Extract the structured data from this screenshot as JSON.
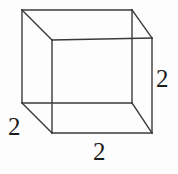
{
  "figure": {
    "name": "cube-wireframe-diagram",
    "background_color": "#fdfdfd",
    "stroke_color": "#3a3a3a",
    "stroke_width": 1.4,
    "width": 178,
    "height": 174
  },
  "shape": {
    "type": "cube",
    "label": "cube",
    "front_face": {
      "name": "front-face",
      "points": [
        [
          52,
          40
        ],
        [
          152,
          38
        ],
        [
          152,
          133
        ],
        [
          52,
          133
        ]
      ]
    },
    "back_face": {
      "name": "back-face",
      "points": [
        [
          22,
          10
        ],
        [
          132,
          10
        ],
        [
          132,
          103
        ],
        [
          22,
          103
        ]
      ]
    },
    "connecting_edges": [
      {
        "name": "edge-top-left",
        "from": [
          22,
          10
        ],
        "to": [
          52,
          40
        ]
      },
      {
        "name": "edge-top-right",
        "from": [
          132,
          10
        ],
        "to": [
          152,
          38
        ]
      },
      {
        "name": "edge-bottom-right",
        "from": [
          132,
          103
        ],
        "to": [
          152,
          133
        ]
      },
      {
        "name": "edge-bottom-left",
        "from": [
          22,
          103
        ],
        "to": [
          52,
          133
        ]
      }
    ]
  },
  "labels": {
    "right": {
      "name": "dimension-label-right",
      "text": "2",
      "edge": "vertical-height",
      "x": 165,
      "y": 81
    },
    "left": {
      "name": "dimension-label-left",
      "text": "2",
      "edge": "depth",
      "x": 17,
      "y": 129
    },
    "bottom": {
      "name": "dimension-label-bottom",
      "text": "2",
      "edge": "horizontal-width",
      "x": 101,
      "y": 154
    }
  }
}
